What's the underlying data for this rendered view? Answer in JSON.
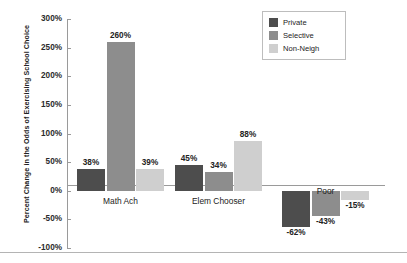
{
  "chart_data": {
    "type": "bar",
    "title": "",
    "xlabel": "",
    "ylabel": "Percent Change in the Odds of Exercising School Choice",
    "ylim": [
      -100,
      300
    ],
    "ytick_labels": [
      "300%",
      "250%",
      "200%",
      "150%",
      "100%",
      "50%",
      "0%",
      "-50%",
      "-100%"
    ],
    "ytick_values": [
      300,
      250,
      200,
      150,
      100,
      50,
      0,
      -50,
      -100
    ],
    "grid": false,
    "legend_position": "top-right",
    "categories": [
      "Math Ach",
      "Elem Chooser",
      "Poor"
    ],
    "series": [
      {
        "name": "Private",
        "color": "#4d4d4d",
        "values": [
          38,
          45,
          -62
        ],
        "labels": [
          "38%",
          "45%",
          "-62%"
        ]
      },
      {
        "name": "Selective",
        "color": "#8d8d8d",
        "values": [
          260,
          34,
          -43
        ],
        "labels": [
          "260%",
          "34%",
          "-43%"
        ]
      },
      {
        "name": "Non-Neigh",
        "color": "#cfcfcf",
        "values": [
          39,
          88,
          -15
        ],
        "labels": [
          "39%",
          "88%",
          "-15%"
        ]
      }
    ]
  },
  "legend": {
    "items": [
      {
        "label": "Private"
      },
      {
        "label": "Selective"
      },
      {
        "label": "Non-Neigh"
      }
    ]
  },
  "axis": {
    "y_title": "Percent Change in the Odds of Exercising School Choice",
    "ticks": [
      "300%",
      "250%",
      "200%",
      "150%",
      "100%",
      "50%",
      "0%",
      "-50%",
      "-100%"
    ]
  },
  "categories": {
    "items": [
      {
        "label": "Math Ach"
      },
      {
        "label": "Elem Chooser"
      },
      {
        "label": "Poor"
      }
    ]
  }
}
